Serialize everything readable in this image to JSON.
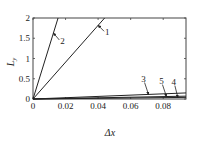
{
  "chart_data": {
    "type": "line",
    "title": "",
    "xlabel": "Δx",
    "ylabel": "L_y",
    "xlim": [
      0,
      0.094
    ],
    "ylim": [
      0,
      2
    ],
    "x_ticks": [
      0,
      0.02,
      0.04,
      0.06,
      0.08
    ],
    "x_tick_labels": [
      "0",
      "0.02",
      "0.04",
      "0.06",
      "0.08"
    ],
    "y_ticks": [
      0,
      0.5,
      1,
      1.5,
      2
    ],
    "y_tick_labels": [
      "0",
      "0.5",
      "1",
      "1.5",
      "2"
    ],
    "grid": false,
    "legend": "inline-numbered-arrows",
    "series": [
      {
        "name": "1",
        "x": [
          0,
          0.044
        ],
        "y": [
          0,
          2.0
        ]
      },
      {
        "name": "2",
        "x": [
          0,
          0.0154
        ],
        "y": [
          0,
          2.0
        ]
      },
      {
        "name": "3",
        "x": [
          0,
          0.094
        ],
        "y": [
          0,
          0.15
        ]
      },
      {
        "name": "4",
        "x": [
          0,
          0.094
        ],
        "y": [
          0,
          0.04
        ]
      },
      {
        "name": "5",
        "x": [
          0,
          0.094
        ],
        "y": [
          0,
          0.07
        ]
      }
    ],
    "annotations": [
      {
        "label": "1",
        "arrow_to": [
          0.04,
          1.82
        ]
      },
      {
        "label": "2",
        "arrow_to": [
          0.0125,
          1.63
        ]
      },
      {
        "label": "3",
        "arrow_to": [
          0.071,
          0.11
        ]
      },
      {
        "label": "5",
        "arrow_to": [
          0.082,
          0.06
        ]
      },
      {
        "label": "4",
        "arrow_to": [
          0.089,
          0.035
        ]
      }
    ]
  }
}
